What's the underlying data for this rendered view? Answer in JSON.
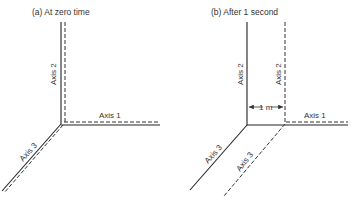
{
  "panels": [
    {
      "caption": "(a) At zero time",
      "axis1_label": "Axis 1",
      "axis2_label": "Axis 2",
      "axis3_label": "Axis 3"
    },
    {
      "caption": "(b) After 1 second",
      "axis1_label": "Axis 1",
      "axis2_solid_label": "Axis 2",
      "axis2_dashed_label": "Axis 2",
      "axis3_solid_label": "Axis 3",
      "axis3_dashed_label": "Axis 3",
      "displacement_label": "1 m"
    }
  ],
  "legend": {
    "solid": "fixed frame",
    "dashed": "moving frame"
  },
  "colors": {
    "line": "#222222",
    "text": "#333333"
  }
}
